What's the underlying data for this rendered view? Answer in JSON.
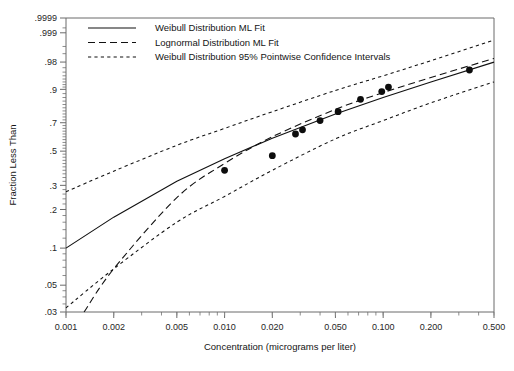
{
  "chart_data": {
    "type": "scatter",
    "title": "",
    "xlabel": "Concentration (micrograms per liter)",
    "ylabel": "Fraction Less Than",
    "xscale": "log",
    "yscale": "weibull-probability",
    "xlim": [
      0.001,
      0.5
    ],
    "ylim": [
      0.03,
      0.9999
    ],
    "grid": false,
    "legend_position": "top-left",
    "x_ticks": [
      {
        "value": 0.001,
        "label": "0.001"
      },
      {
        "value": 0.002,
        "label": "0.002"
      },
      {
        "value": 0.005,
        "label": "0.005"
      },
      {
        "value": 0.01,
        "label": "0.010"
      },
      {
        "value": 0.02,
        "label": "0.020"
      },
      {
        "value": 0.05,
        "label": "0.050"
      },
      {
        "value": 0.1,
        "label": "0.100"
      },
      {
        "value": 0.2,
        "label": "0.200"
      },
      {
        "value": 0.5,
        "label": "0.500"
      }
    ],
    "y_ticks": [
      {
        "value": 0.9999,
        "label": ".9999"
      },
      {
        "value": 0.999,
        "label": ".999"
      },
      {
        "value": 0.98,
        "label": ".98"
      },
      {
        "value": 0.9,
        "label": ".9"
      },
      {
        "value": 0.7,
        "label": ".7"
      },
      {
        "value": 0.5,
        "label": ".5"
      },
      {
        "value": 0.3,
        "label": ".3"
      },
      {
        "value": 0.2,
        "label": ".2"
      },
      {
        "value": 0.1,
        "label": ".1"
      },
      {
        "value": 0.05,
        "label": ".05"
      },
      {
        "value": 0.03,
        "label": ".03"
      }
    ],
    "y_minor_ticks": [
      0.0005,
      0.0007,
      0.9995,
      0.995,
      0.99,
      0.97,
      0.96,
      0.95,
      0.94,
      0.93,
      0.92,
      0.91,
      0.88,
      0.86,
      0.84,
      0.82,
      0.8,
      0.78,
      0.76,
      0.74,
      0.72,
      0.68,
      0.66,
      0.64,
      0.62,
      0.6,
      0.58,
      0.56,
      0.54,
      0.52,
      0.48,
      0.46,
      0.44,
      0.42,
      0.4,
      0.38,
      0.36,
      0.34,
      0.32,
      0.28,
      0.26,
      0.24,
      0.22,
      0.18,
      0.16,
      0.14,
      0.12,
      0.09,
      0.08,
      0.07,
      0.06,
      0.045,
      0.04,
      0.035
    ],
    "series": [
      {
        "name": "data-points",
        "style": "filled-circle",
        "points": [
          {
            "x": 0.01,
            "y": 0.38
          },
          {
            "x": 0.02,
            "y": 0.47
          },
          {
            "x": 0.028,
            "y": 0.62
          },
          {
            "x": 0.031,
            "y": 0.65
          },
          {
            "x": 0.04,
            "y": 0.715
          },
          {
            "x": 0.052,
            "y": 0.775
          },
          {
            "x": 0.072,
            "y": 0.85
          },
          {
            "x": 0.098,
            "y": 0.89
          },
          {
            "x": 0.108,
            "y": 0.91
          },
          {
            "x": 0.35,
            "y": 0.965
          }
        ]
      },
      {
        "name": "Weibull Distribution ML Fit",
        "style": "solid",
        "points": [
          {
            "x": 0.001,
            "y": 0.1
          },
          {
            "x": 0.002,
            "y": 0.175
          },
          {
            "x": 0.005,
            "y": 0.32
          },
          {
            "x": 0.01,
            "y": 0.45
          },
          {
            "x": 0.02,
            "y": 0.59
          },
          {
            "x": 0.05,
            "y": 0.76
          },
          {
            "x": 0.1,
            "y": 0.86
          },
          {
            "x": 0.2,
            "y": 0.93
          },
          {
            "x": 0.5,
            "y": 0.98
          }
        ]
      },
      {
        "name": "Lognormal Distribution ML Fit",
        "style": "dashed",
        "points": [
          {
            "x": 0.0013,
            "y": 0.03
          },
          {
            "x": 0.002,
            "y": 0.068
          },
          {
            "x": 0.005,
            "y": 0.245
          },
          {
            "x": 0.01,
            "y": 0.42
          },
          {
            "x": 0.02,
            "y": 0.6
          },
          {
            "x": 0.05,
            "y": 0.79
          },
          {
            "x": 0.1,
            "y": 0.885
          },
          {
            "x": 0.2,
            "y": 0.945
          },
          {
            "x": 0.5,
            "y": 0.985
          }
        ]
      },
      {
        "name": "Weibull Distribution 95% Pointwise Confidence Intervals Upper",
        "style": "dotted",
        "points": [
          {
            "x": 0.001,
            "y": 0.27
          },
          {
            "x": 0.002,
            "y": 0.375
          },
          {
            "x": 0.005,
            "y": 0.54
          },
          {
            "x": 0.01,
            "y": 0.66
          },
          {
            "x": 0.02,
            "y": 0.775
          },
          {
            "x": 0.05,
            "y": 0.895
          },
          {
            "x": 0.1,
            "y": 0.95
          },
          {
            "x": 0.2,
            "y": 0.982
          },
          {
            "x": 0.5,
            "y": 0.9975
          }
        ]
      },
      {
        "name": "Weibull Distribution 95% Pointwise Confidence Intervals Lower",
        "style": "dotted",
        "points": [
          {
            "x": 0.001,
            "y": 0.0325
          },
          {
            "x": 0.002,
            "y": 0.068
          },
          {
            "x": 0.005,
            "y": 0.16
          },
          {
            "x": 0.01,
            "y": 0.25
          },
          {
            "x": 0.02,
            "y": 0.38
          },
          {
            "x": 0.05,
            "y": 0.585
          },
          {
            "x": 0.1,
            "y": 0.715
          },
          {
            "x": 0.2,
            "y": 0.83
          },
          {
            "x": 0.5,
            "y": 0.93
          }
        ]
      }
    ],
    "legend": [
      {
        "label": "Weibull Distribution ML Fit",
        "style": "solid"
      },
      {
        "label": "Lognormal Distribution ML Fit",
        "style": "dashed"
      },
      {
        "label": "Weibull Distribution 95% Pointwise Confidence Intervals",
        "style": "dotted"
      }
    ]
  },
  "colors": {
    "ink": "#111111",
    "axis": "#6b6b6b",
    "background": "#ffffff"
  }
}
